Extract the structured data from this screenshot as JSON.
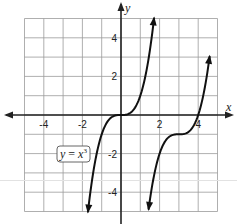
{
  "chart_data": {
    "type": "line",
    "title": "",
    "xlabel": "x",
    "ylabel": "y",
    "xlim": [
      -5,
      5
    ],
    "ylim": [
      -5,
      5
    ],
    "grid": true,
    "grid_step": 1,
    "x_ticks": [
      -4,
      -2,
      2,
      4
    ],
    "y_ticks": [
      4,
      2,
      -2,
      -4
    ],
    "x_tick_labels": [
      "-4",
      "-2",
      "2",
      "4"
    ],
    "y_tick_labels": [
      "4",
      "2",
      "-2",
      "-4"
    ],
    "series": [
      {
        "name": "y = x³",
        "function": "y = x^3",
        "x_range": [
          -1.71,
          1.71
        ],
        "points": [
          [
            -1.71,
            -5
          ],
          [
            -1.5,
            -3.375
          ],
          [
            -1,
            -1
          ],
          [
            -0.5,
            -0.125
          ],
          [
            0,
            0
          ],
          [
            0.5,
            0.125
          ],
          [
            1,
            1
          ],
          [
            1.5,
            3.375
          ],
          [
            1.71,
            5
          ]
        ],
        "arrows": "both"
      },
      {
        "name": "translated cubic",
        "function": "y = (x - 3)^3 - 1",
        "x_range": [
          1.43,
          4.59
        ],
        "points": [
          [
            1.43,
            -5
          ],
          [
            1.5,
            -4.375
          ],
          [
            2,
            -2
          ],
          [
            2.5,
            -1.125
          ],
          [
            3,
            -1
          ],
          [
            3.5,
            -0.875
          ],
          [
            4,
            0
          ],
          [
            4.5,
            2.375
          ],
          [
            4.59,
            3
          ]
        ],
        "arrows": "both"
      }
    ],
    "annotations": [
      {
        "text": "y = x³",
        "boxed": true,
        "near": [
          -2.6,
          -2.1
        ]
      }
    ],
    "colors": {
      "curve": "#111111",
      "grid": "#9a9a9a",
      "axis": "#222222"
    }
  },
  "labels": {
    "x_axis": "x",
    "y_axis": "y",
    "equation_y": "y",
    "equation_eq": " = ",
    "equation_x": "x",
    "equation_exp": "3"
  }
}
